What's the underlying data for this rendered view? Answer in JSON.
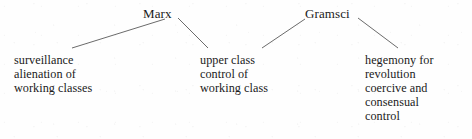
{
  "diagram": {
    "type": "concept-tree",
    "background_color": "#fefefe",
    "text_color": "#1a1a1a",
    "line_color": "#6b6b6b",
    "roots": [
      {
        "id": "marx",
        "label": "Marx"
      },
      {
        "id": "gramsci",
        "label": "Gramsci"
      }
    ],
    "leaves": [
      {
        "id": "surveillance-alienation",
        "parent": "marx",
        "lines": [
          "surveillance",
          "alienation of",
          "working classes"
        ]
      },
      {
        "id": "upper-class-control",
        "parent": "marx",
        "lines": [
          "upper class",
          "control of",
          "working class"
        ]
      },
      {
        "id": "hegemony-revolution",
        "parent": "gramsci",
        "lines": [
          "hegemony for",
          "revolution",
          "coercive and",
          "consensual",
          "control"
        ]
      }
    ],
    "connectors": [
      {
        "name": "marx-to-surveillance",
        "x1": 72,
        "y1": 48,
        "x2": 165,
        "y2": 19
      },
      {
        "name": "marx-to-upper-class",
        "x1": 178,
        "y1": 18,
        "x2": 208,
        "y2": 48
      },
      {
        "name": "gramsci-to-upper-class",
        "x1": 262,
        "y1": 48,
        "x2": 305,
        "y2": 19
      },
      {
        "name": "gramsci-to-hegemony",
        "x1": 358,
        "y1": 18,
        "x2": 398,
        "y2": 48
      }
    ]
  }
}
